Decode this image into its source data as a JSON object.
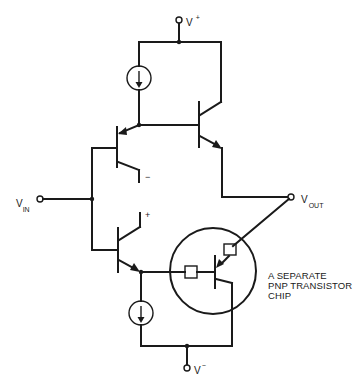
{
  "diagram": {
    "type": "circuit-schematic",
    "terminals": {
      "v_plus": {
        "main": "V",
        "sup": "+"
      },
      "v_minus": {
        "main": "V",
        "sup": "−"
      },
      "v_in": {
        "main": "V",
        "sub": "IN"
      },
      "v_out": {
        "main": "V",
        "sub": "OUT"
      }
    },
    "polarity": {
      "inverting": "−",
      "non_inverting": "+"
    },
    "annotation": {
      "lines": [
        "A SEPARATE",
        "PNP TRANSISTOR",
        "CHIP"
      ]
    },
    "components": [
      {
        "id": "I1",
        "kind": "current-source",
        "direction": "down",
        "between": [
          "V+ rail",
          "Q1/Q2 node"
        ]
      },
      {
        "id": "Q1",
        "kind": "pnp-transistor",
        "base": "VIN",
        "collector": "− input"
      },
      {
        "id": "Q2",
        "kind": "npn-transistor",
        "collector": "V+",
        "emitter": "VOUT"
      },
      {
        "id": "Q3",
        "kind": "npn-transistor",
        "base": "VIN",
        "collector": "+ input"
      },
      {
        "id": "I2",
        "kind": "current-source",
        "direction": "down",
        "between": [
          "Q3 emitter node",
          "V- rail"
        ]
      },
      {
        "id": "Q4",
        "kind": "pnp-transistor",
        "chip": "separate",
        "emitter": "VOUT",
        "collector": "V-"
      }
    ]
  }
}
